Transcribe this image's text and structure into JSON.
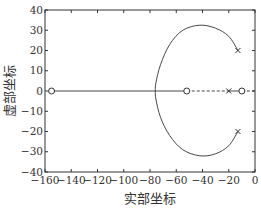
{
  "chart_data": {
    "type": "line",
    "subtype": "root-locus",
    "title": "",
    "xlabel": "实部坐标",
    "ylabel": "虚部坐标",
    "xlim": [
      -160,
      0
    ],
    "ylim": [
      -40,
      40
    ],
    "xticks": [
      -160,
      -140,
      -120,
      -100,
      -80,
      -60,
      -40,
      -20,
      0
    ],
    "xtick_labels": [
      "−160",
      "−140",
      "−120",
      "−100",
      "−80",
      "−60",
      "−40",
      "−20",
      "0"
    ],
    "yticks": [
      40,
      30,
      20,
      10,
      0,
      -10,
      -20,
      -30,
      -40
    ],
    "ytick_labels": [
      "40",
      "30",
      "20",
      "10",
      "0",
      "−10",
      "−20",
      "−30",
      "−40"
    ],
    "grid": false,
    "legend": null,
    "poles": [
      {
        "re": -13,
        "im": 20
      },
      {
        "re": -13,
        "im": -20
      },
      {
        "re": -20,
        "im": 0
      }
    ],
    "zeros": [
      {
        "re": -155,
        "im": 0
      },
      {
        "re": -52,
        "im": 0
      },
      {
        "re": -10,
        "im": 0
      }
    ],
    "series": [
      {
        "name": "locus-upper-branch",
        "style": "solid",
        "points": [
          [
            -13,
            20
          ],
          [
            -20,
            27
          ],
          [
            -30,
            31
          ],
          [
            -42,
            32.5
          ],
          [
            -55,
            30
          ],
          [
            -65,
            23
          ],
          [
            -72,
            13
          ],
          [
            -75.5,
            4
          ],
          [
            -76,
            0
          ]
        ]
      },
      {
        "name": "locus-lower-branch",
        "style": "solid",
        "points": [
          [
            -13,
            -20
          ],
          [
            -20,
            -27
          ],
          [
            -30,
            -31
          ],
          [
            -42,
            -32
          ],
          [
            -55,
            -29
          ],
          [
            -65,
            -22
          ],
          [
            -72,
            -13
          ],
          [
            -75.5,
            -4
          ],
          [
            -76,
            0
          ]
        ]
      },
      {
        "name": "real-axis-segment-left",
        "style": "solid",
        "points": [
          [
            -155,
            0
          ],
          [
            -52,
            0
          ]
        ]
      },
      {
        "name": "real-axis-segment-right",
        "style": "dashed",
        "points": [
          [
            -52,
            0
          ],
          [
            -20,
            0
          ]
        ]
      },
      {
        "name": "real-axis-segment-pole-zero",
        "style": "solid",
        "points": [
          [
            -20,
            0
          ],
          [
            -10,
            0
          ]
        ]
      },
      {
        "name": "real-axis-segment-end",
        "style": "dashed",
        "points": [
          [
            -10,
            0
          ],
          [
            0,
            0
          ]
        ]
      }
    ]
  }
}
